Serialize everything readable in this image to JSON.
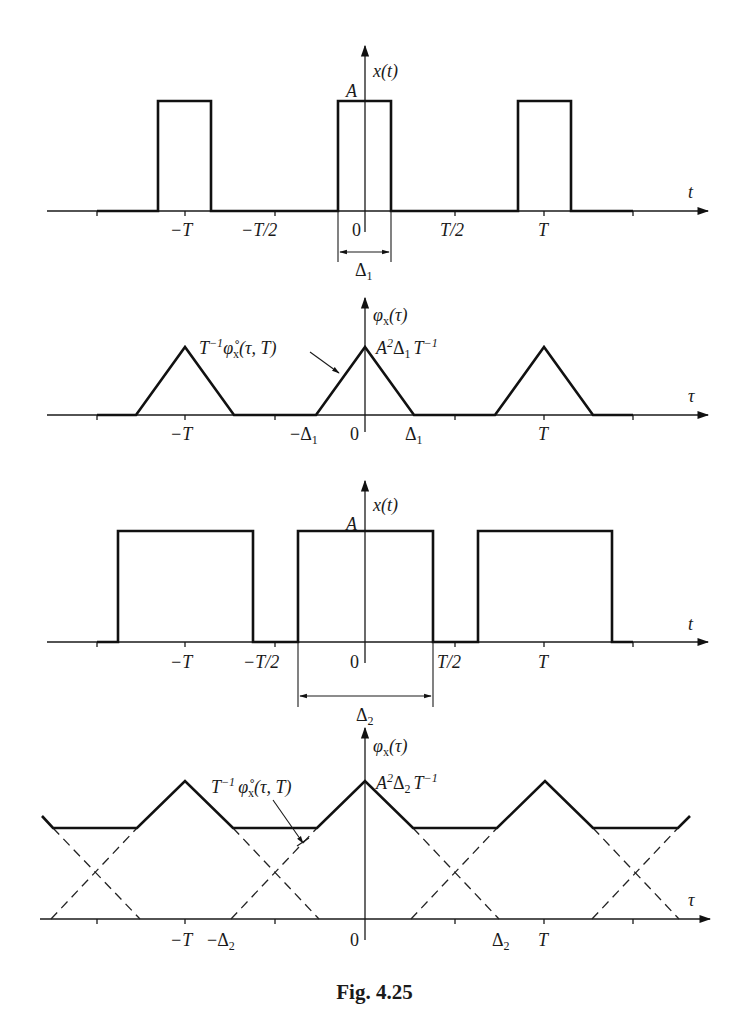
{
  "figure": {
    "caption": "Fig. 4.25",
    "panels": [
      {
        "id": "x1",
        "title": "x(t)",
        "axis_label": "t",
        "amplitude_label": "A",
        "ticks": [
          "−T",
          "−T/2",
          "0",
          "T/2",
          "T"
        ],
        "width_label": "Δ",
        "width_sub": "1"
      },
      {
        "id": "phi1",
        "title": "φ",
        "title_sub": "x",
        "title_arg": "(τ)",
        "axis_label": "τ",
        "peak_label_main": "A",
        "peak_label_sup": "2",
        "peak_label_delta": "Δ",
        "peak_label_delta_sub": "1",
        "peak_label_T": "T",
        "peak_label_T_sup": "−1",
        "curve_label_T": "T",
        "curve_label_T_sup": "−1",
        "curve_label_phi": "φ̊",
        "curve_label_sub": "x",
        "curve_label_arg": "(τ, T)",
        "ticks": [
          "−T",
          "−Δ",
          "0",
          "Δ",
          "T"
        ],
        "tick_sub": "1"
      },
      {
        "id": "x2",
        "title": "x(t)",
        "axis_label": "t",
        "amplitude_label": "A",
        "ticks": [
          "−T",
          "−T/2",
          "0",
          "T/2",
          "T"
        ],
        "width_label": "Δ",
        "width_sub": "2"
      },
      {
        "id": "phi2",
        "title": "φ",
        "title_sub": "x",
        "title_arg": "(τ)",
        "axis_label": "τ",
        "peak_label_main": "A",
        "peak_label_sup": "2",
        "peak_label_delta": "Δ",
        "peak_label_delta_sub": "2",
        "peak_label_T": "T",
        "peak_label_T_sup": "−1",
        "curve_label_T": "T",
        "curve_label_T_sup": "−1",
        "curve_label_phi": "φ̊",
        "curve_label_sub": "x",
        "curve_label_arg": "(τ, T)",
        "ticks": [
          "−T",
          "−Δ",
          "0",
          "Δ",
          "T"
        ],
        "tick_sub": "2"
      }
    ]
  }
}
